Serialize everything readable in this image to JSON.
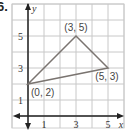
{
  "problem_number": "6.",
  "chart_data": {
    "type": "scatter",
    "title": "",
    "xlabel": "x",
    "ylabel": "y",
    "xlim": [
      -1,
      6
    ],
    "ylim": [
      -1,
      7
    ],
    "grid": true,
    "x_ticks": [
      1,
      3,
      5
    ],
    "y_ticks": [
      1,
      3,
      5
    ],
    "shape": "triangle",
    "points": [
      {
        "x": 0,
        "y": 2,
        "label": "(0, 2)"
      },
      {
        "x": 3,
        "y": 5,
        "label": "(3, 5)"
      },
      {
        "x": 5,
        "y": 3,
        "label": "(5, 3)"
      }
    ],
    "colors": {
      "grid": "#c8c8c8",
      "axis": "#222222",
      "triangle": "#7a7470"
    }
  }
}
